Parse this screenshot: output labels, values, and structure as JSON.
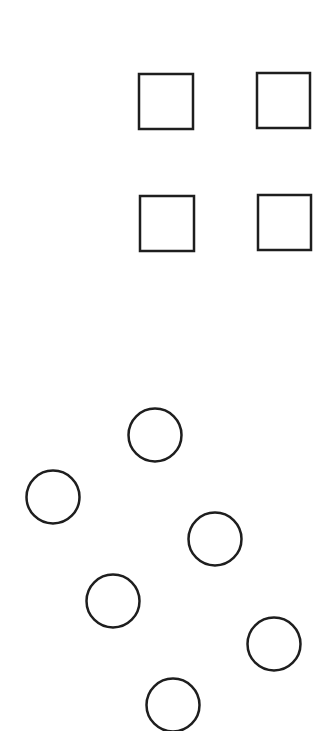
{
  "canvas": {
    "width": 318,
    "height": 731,
    "background": "#ffffff"
  },
  "style": {
    "stroke": "#1e1e1e",
    "stroke_width": 2.5,
    "fill": "none"
  },
  "squares": [
    {
      "id": "square-1",
      "x": 139,
      "y": 74,
      "w": 54,
      "h": 55
    },
    {
      "id": "square-2",
      "x": 257,
      "y": 73,
      "w": 53,
      "h": 55
    },
    {
      "id": "square-3",
      "x": 140,
      "y": 196,
      "w": 54,
      "h": 55
    },
    {
      "id": "square-4",
      "x": 258,
      "y": 195,
      "w": 53,
      "h": 55
    }
  ],
  "circles": [
    {
      "id": "circle-1",
      "cx": 155,
      "cy": 435,
      "r": 26.5
    },
    {
      "id": "circle-2",
      "cx": 53,
      "cy": 497,
      "r": 26.5
    },
    {
      "id": "circle-3",
      "cx": 215,
      "cy": 539,
      "r": 26.5
    },
    {
      "id": "circle-4",
      "cx": 113,
      "cy": 601,
      "r": 26.5
    },
    {
      "id": "circle-5",
      "cx": 274,
      "cy": 644,
      "r": 26.5
    },
    {
      "id": "circle-6",
      "cx": 173,
      "cy": 705,
      "r": 26.5
    }
  ]
}
